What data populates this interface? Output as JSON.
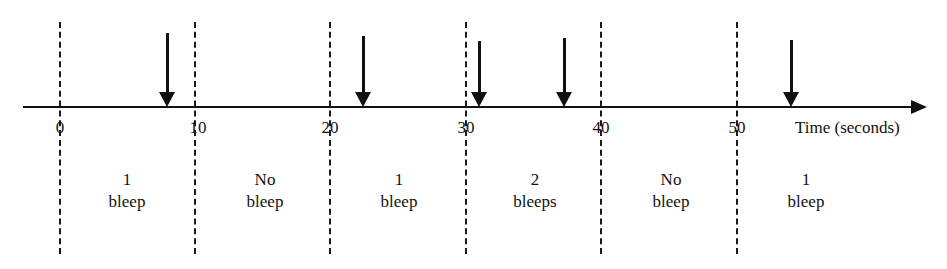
{
  "diagram": {
    "type": "timeline",
    "axis_label": "Time (seconds)",
    "ticks": [
      "0",
      "10",
      "20",
      "30",
      "40",
      "50"
    ],
    "tick_values": [
      0,
      10,
      20,
      30,
      40,
      50
    ],
    "bleep_times_seconds": [
      7.9,
      22.4,
      31.0,
      37.3,
      54.0
    ],
    "segments": [
      {
        "range": "0-10",
        "count_label": "1",
        "unit_label": "bleep"
      },
      {
        "range": "10-20",
        "count_label": "No",
        "unit_label": "bleep"
      },
      {
        "range": "20-30",
        "count_label": "1",
        "unit_label": "bleep"
      },
      {
        "range": "30-40",
        "count_label": "2",
        "unit_label": "bleeps"
      },
      {
        "range": "40-50",
        "count_label": "No",
        "unit_label": "bleep"
      },
      {
        "range": "50-60",
        "count_label": "1",
        "unit_label": "bleep"
      }
    ],
    "colors": {
      "line": "#111111",
      "background": "#ffffff"
    }
  }
}
